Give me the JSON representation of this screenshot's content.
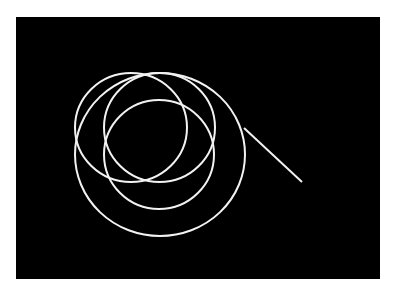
{
  "page": {
    "background": "#ffffff"
  },
  "panel": {
    "x": 16,
    "y": 17,
    "width": 364,
    "height": 262,
    "fill": "#000000"
  },
  "stroke": {
    "color": "#f2f2f2",
    "width": 2
  },
  "shapes": {
    "ellipses": [
      {
        "name": "ellipse-upper-left",
        "cx": 131,
        "cy": 127.5,
        "rx": 56,
        "ry": 54.5
      },
      {
        "name": "ellipse-upper-right",
        "cx": 159.5,
        "cy": 127.5,
        "rx": 55.5,
        "ry": 54.5
      },
      {
        "name": "ellipse-lower-inner",
        "cx": 159,
        "cy": 154.5,
        "rx": 55,
        "ry": 54.5
      },
      {
        "name": "ellipse-large-outer",
        "cx": 160,
        "cy": 154.5,
        "rx": 85,
        "ry": 81.5
      }
    ],
    "lines": [
      {
        "name": "diagonal-line",
        "x1": 244,
        "y1": 128,
        "x2": 302,
        "y2": 182
      }
    ]
  }
}
